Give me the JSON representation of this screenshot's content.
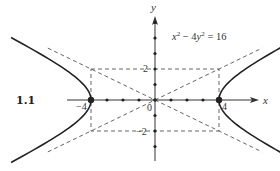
{
  "figure_label": "1.1",
  "equation": {
    "x_var": "x",
    "x_exp": "2",
    "minus": " − 4",
    "y_var": "y",
    "y_exp": "2",
    "rhs": " = 16"
  },
  "axes": {
    "x_name": "x",
    "y_name": "y",
    "x_range": [
      -5.5,
      6.5
    ],
    "y_range": [
      -4,
      5.5
    ],
    "x_dot_ticks": [
      -4,
      -3,
      -2,
      -1,
      1,
      2,
      3,
      4
    ],
    "y_dot_ticks": [
      -3,
      -2,
      -1,
      1,
      2,
      3,
      4,
      5
    ],
    "x_tick_labels": [
      {
        "value": -4,
        "text": "−4"
      },
      {
        "value": 4,
        "text": "4"
      }
    ],
    "y_tick_labels": [
      {
        "value": 2,
        "text": "2"
      },
      {
        "value": -2,
        "text": "−2"
      }
    ],
    "origin_label": "0"
  },
  "hyperbola": {
    "a": 4,
    "b": 2,
    "vertices": [
      [
        -4,
        0
      ],
      [
        4,
        0
      ]
    ],
    "asymptote_slopes": [
      0.5,
      -0.5
    ]
  },
  "rectangle": {
    "x": [
      -4,
      4
    ],
    "y": [
      -2,
      2
    ]
  },
  "colors": {
    "curve": "#222222",
    "dashed": "#555555",
    "axis": "#333333"
  }
}
